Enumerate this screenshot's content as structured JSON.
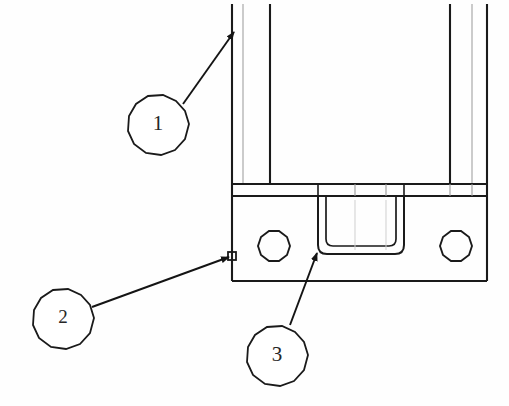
{
  "drawing": {
    "title": "Bracket assembly detail view",
    "background_color": "#fefefe",
    "line_color": "#1a1a1a",
    "light_line_color": "#9a9a9a",
    "callouts": [
      {
        "id": "callout-1",
        "label": "1",
        "balloon_cx": 158,
        "balloon_cy": 124,
        "balloon_r": 31,
        "leader_start_x": 183,
        "leader_start_y": 104,
        "leader_end_x": 234,
        "leader_end_y": 32,
        "target": "left-outer-vertical-edge",
        "compressed": false
      },
      {
        "id": "callout-2",
        "label": "2",
        "balloon_cx": 63,
        "balloon_cy": 318,
        "balloon_r": 31,
        "leader_start_x": 92,
        "leader_start_y": 307,
        "leader_end_x": 227,
        "leader_end_y": 257,
        "target": "small-square-feature-on-flange-edge",
        "compressed": true
      },
      {
        "id": "callout-3",
        "label": "3",
        "balloon_cx": 277,
        "balloon_cy": 355,
        "balloon_r": 31,
        "leader_start_x": 290,
        "leader_start_y": 325,
        "leader_end_x": 318,
        "leader_end_y": 252,
        "target": "u-notch-lower-left-corner",
        "compressed": false
      }
    ],
    "geometry": {
      "body": {
        "left_outer_x": 232,
        "left_light_x": 243,
        "left_inner_x": 270,
        "right_inner_x": 450,
        "right_light_x": 472,
        "right_outer_x": 487,
        "top_y": 4,
        "band_top_y": 184,
        "band_bottom_y": 196
      },
      "flange": {
        "left_x": 232,
        "right_x": 487,
        "top_y": 196,
        "bottom_y": 281
      },
      "holes": [
        {
          "cx": 274,
          "cy": 246,
          "r": 16
        },
        {
          "cx": 456,
          "cy": 246,
          "r": 16
        }
      ],
      "notch": {
        "outer_left_x": 318,
        "outer_right_x": 404,
        "top_y": 196,
        "outer_bottom_y": 254,
        "inner_left_x": 326,
        "inner_right_x": 396,
        "inner_bottom_y": 246,
        "corner_radius": 8
      },
      "square_feature": {
        "cx": 232,
        "cy": 256,
        "size": 7
      },
      "band_dividers_x": [
        318,
        355,
        386,
        404,
        450,
        472
      ]
    }
  }
}
